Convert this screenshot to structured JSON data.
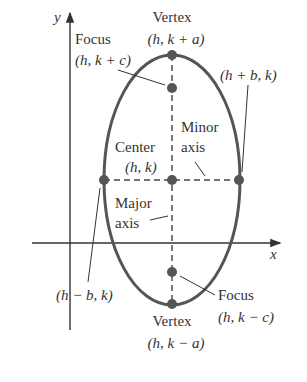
{
  "diagram": {
    "type": "vertical-ellipse",
    "colors": {
      "curve": "#555555",
      "axis": "#333333",
      "point": "#555555",
      "text": "#333333"
    },
    "axes": {
      "x_label": "x",
      "y_label": "y"
    },
    "labels": {
      "vertex_top_title": "Vertex",
      "vertex_top_coord": "(h, k + a)",
      "focus_top_title": "Focus",
      "focus_top_coord": "(h, k + c)",
      "right_point_coord": "(h + b, k)",
      "center_title": "Center",
      "center_coord": "(h, k)",
      "minor_axis_line1": "Minor",
      "minor_axis_line2": "axis",
      "major_axis_line1": "Major",
      "major_axis_line2": "axis",
      "left_point_coord": "(h − b, k)",
      "focus_bottom_title": "Focus",
      "focus_bottom_coord": "(h, k − c)",
      "vertex_bottom_title": "Vertex",
      "vertex_bottom_coord": "(h, k − a)"
    }
  }
}
